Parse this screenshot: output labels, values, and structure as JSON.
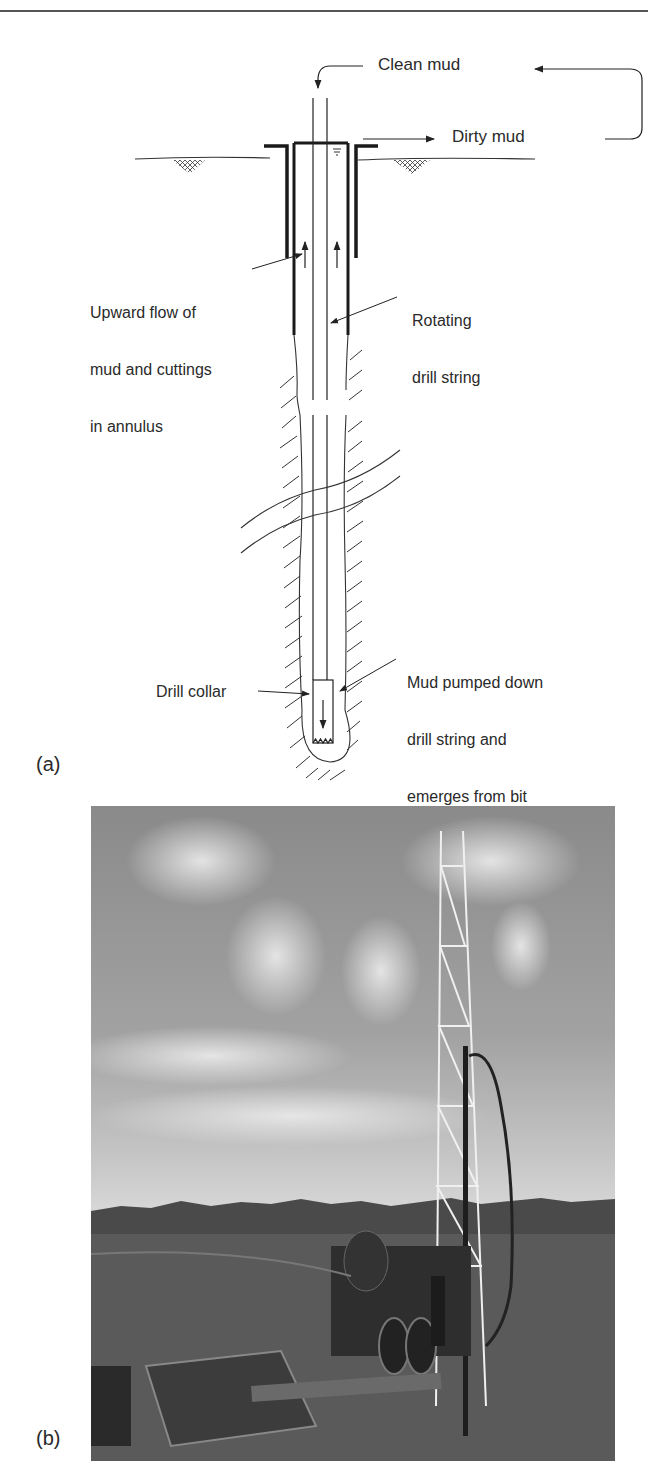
{
  "figure": {
    "panel_a": {
      "label": "(a)",
      "annotations": {
        "clean_mud": "Clean mud",
        "dirty_mud": "Dirty mud",
        "upward_flow": [
          "Upward flow of",
          "mud and cuttings",
          "in annulus"
        ],
        "rotating_drill_string": [
          "Rotating",
          "drill string"
        ],
        "mud_pumped_down": [
          "Mud pumped down",
          "drill string and",
          "emerges from bit"
        ],
        "drill_collar": "Drill collar"
      }
    },
    "panel_b": {
      "label": "(b)",
      "description": "Photograph of a drilling rig with lattice mast, truck, mud tank and drill pipes in a cleared field under a cloudy sky"
    }
  },
  "colors": {
    "line": "#222222",
    "text": "#2a2a2a",
    "background": "#ffffff"
  }
}
